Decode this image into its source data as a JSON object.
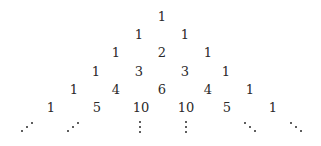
{
  "rows": [
    {
      "y": 16,
      "cells": [
        {
          "v": "1",
          "x": 162
        }
      ]
    },
    {
      "y": 34,
      "cells": [
        {
          "v": "1",
          "x": 139
        },
        {
          "v": "1",
          "x": 185
        }
      ]
    },
    {
      "y": 52,
      "cells": [
        {
          "v": "1",
          "x": 116
        },
        {
          "v": "2",
          "x": 162
        },
        {
          "v": "1",
          "x": 208
        }
      ]
    },
    {
      "y": 71,
      "cells": [
        {
          "v": "1",
          "x": 96
        },
        {
          "v": "3",
          "x": 139
        },
        {
          "v": "3",
          "x": 185
        },
        {
          "v": "1",
          "x": 226
        }
      ]
    },
    {
      "y": 89,
      "cells": [
        {
          "v": "1",
          "x": 74
        },
        {
          "v": "4",
          "x": 116
        },
        {
          "v": "6",
          "x": 162
        },
        {
          "v": "4",
          "x": 208
        },
        {
          "v": "1",
          "x": 250
        }
      ]
    },
    {
      "y": 107,
      "cells": [
        {
          "v": "1",
          "x": 51
        },
        {
          "v": "5",
          "x": 97
        },
        {
          "v": "10",
          "x": 141
        },
        {
          "v": "10",
          "x": 186
        },
        {
          "v": "5",
          "x": 227
        },
        {
          "v": "1",
          "x": 273
        }
      ]
    }
  ],
  "ellipsis_row": {
    "y": 127,
    "items": [
      {
        "type": "up-diagonal",
        "x": 27
      },
      {
        "type": "up-diagonal",
        "x": 73
      },
      {
        "type": "vertical",
        "x": 140
      },
      {
        "type": "vertical",
        "x": 186
      },
      {
        "type": "down-diagonal",
        "x": 250
      },
      {
        "type": "down-diagonal",
        "x": 296
      }
    ]
  },
  "colors": {
    "text": "#2a2a2a",
    "background": "#ffffff"
  }
}
